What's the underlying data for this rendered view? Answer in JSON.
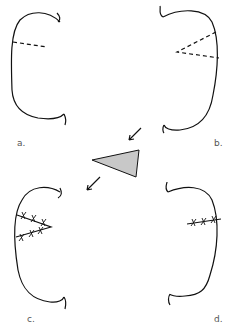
{
  "diagram": {
    "panels": [
      {
        "id": "a",
        "label": "a.",
        "content": "ear outline with single dashed incision line"
      },
      {
        "id": "b",
        "label": "b.",
        "content": "ear outline with dashed wedge (triangle) incision"
      },
      {
        "id": "c",
        "label": "c.",
        "content": "ear outline with wedge removed, sutured edges (x marks)"
      },
      {
        "id": "d",
        "label": "d.",
        "content": "ear outline with single sutured closure line"
      }
    ],
    "center": {
      "content": "excised gray triangular wedge with arrows from b to c"
    },
    "colors": {
      "line": "#111111",
      "wedge_fill": "#c8c8c8",
      "shading": "#999999"
    }
  }
}
